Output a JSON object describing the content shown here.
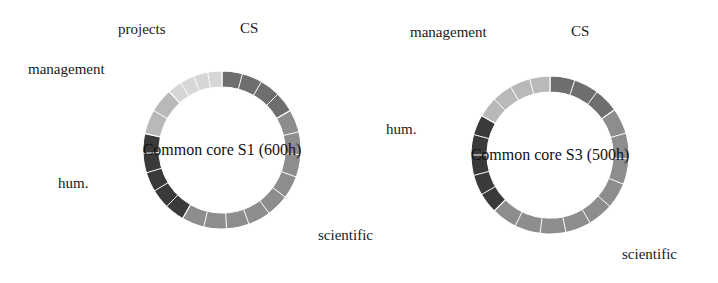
{
  "figure": {
    "background": "#ffffff",
    "text_color": "#1a1a1a"
  },
  "palette": {
    "cs": "#6e6e6e",
    "scientific": "#8d8d8d",
    "hum": "#3a3a3a",
    "management": "#b9b9b9",
    "projects": "#d6d6d6",
    "divider": "#ffffff"
  },
  "charts": [
    {
      "id": "common-core-s1",
      "center_label": "Common core S1 (600h)",
      "cx": 222,
      "cy": 150,
      "r_outer": 79,
      "r_inner": 63,
      "labels": [
        {
          "name": "projects",
          "text": "projects",
          "x": 118,
          "y": 22
        },
        {
          "name": "cs",
          "text": "CS",
          "x": 240,
          "y": 21
        },
        {
          "name": "management",
          "text": "management",
          "x": 28,
          "y": 62
        },
        {
          "name": "hum",
          "text": "hum.",
          "x": 58,
          "y": 176
        },
        {
          "name": "scientific",
          "text": "scientific",
          "x": 318,
          "y": 228
        }
      ]
    },
    {
      "id": "common-core-s3",
      "center_label": "Common core S3 (500h)",
      "cx": 550,
      "cy": 155,
      "r_outer": 79,
      "r_inner": 63,
      "labels": [
        {
          "name": "management",
          "text": "management",
          "x": 410,
          "y": 25
        },
        {
          "name": "cs",
          "text": "CS",
          "x": 571,
          "y": 24
        },
        {
          "name": "hum",
          "text": "hum.",
          "x": 386,
          "y": 122
        },
        {
          "name": "scientific",
          "text": "scientific",
          "x": 622,
          "y": 247
        }
      ]
    }
  ],
  "chart_data": [
    {
      "type": "pie",
      "variant": "donut",
      "title": "Common core S1 (600h)",
      "total_hours": 600,
      "units": "hours",
      "start_angle_deg": 0,
      "direction": "clockwise",
      "labels": [
        "CS",
        "scientific",
        "hum.",
        "management",
        "projects"
      ],
      "values": [
        100,
        250,
        120,
        60,
        70
      ],
      "angles_deg": [
        60,
        150,
        72,
        36,
        42
      ],
      "percents": [
        16.7,
        41.7,
        20.0,
        10.0,
        11.7
      ],
      "colors": [
        "#6e6e6e",
        "#8d8d8d",
        "#3a3a3a",
        "#b9b9b9",
        "#d6d6d6"
      ],
      "subdivisions": [
        4,
        9,
        5,
        2,
        4
      ],
      "legend_position": "around-ring",
      "grid": false
    },
    {
      "type": "pie",
      "variant": "donut",
      "title": "Common core S3 (500h)",
      "total_hours": 500,
      "units": "hours",
      "start_angle_deg": 0,
      "direction": "clockwise",
      "labels": [
        "CS",
        "scientific",
        "hum.",
        "management"
      ],
      "values": [
        76,
        236,
        104,
        84
      ],
      "angles_deg": [
        55,
        170,
        75,
        60
      ],
      "percents": [
        15.3,
        47.2,
        20.8,
        16.7
      ],
      "colors": [
        "#6e6e6e",
        "#8d8d8d",
        "#3a3a3a",
        "#b9b9b9"
      ],
      "subdivisions": [
        3,
        9,
        5,
        4
      ],
      "legend_position": "around-ring",
      "grid": false
    }
  ]
}
